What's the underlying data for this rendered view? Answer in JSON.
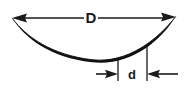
{
  "figure": {
    "type": "engineering-dimension-diagram",
    "background_color": "#ffffff",
    "line_color": "#1a1a1a",
    "curve_color": "#111111"
  },
  "labels": {
    "width_dimension": "D",
    "depth_dimension": "d"
  },
  "dimensions": {
    "width_leader": {
      "name": "D",
      "left_arrow_tip_x": 12,
      "right_arrow_tip_x": 176,
      "line_y": 18,
      "arrow_style": "double-ended-outward"
    },
    "depth_leader": {
      "name": "d",
      "left_arrow_tip_x": 118,
      "right_arrow_tip_x": 147,
      "line_y": 74,
      "arrow_style": "double-ended-inward"
    }
  },
  "extension_lines": [
    {
      "name": "left-extension-line",
      "x": 118,
      "y_top": 59,
      "y_bottom": 81
    },
    {
      "name": "right-extension-line",
      "x": 147,
      "y_top": 47,
      "y_bottom": 81
    }
  ],
  "curve": {
    "name": "dished-profile-curve",
    "start_x": 12,
    "start_y": 19,
    "end_x": 175,
    "end_y": 18,
    "lowest_y": 61,
    "lowest_x": 90,
    "stroke_width_max": 2.6,
    "stroke_width_min": 1.0
  }
}
